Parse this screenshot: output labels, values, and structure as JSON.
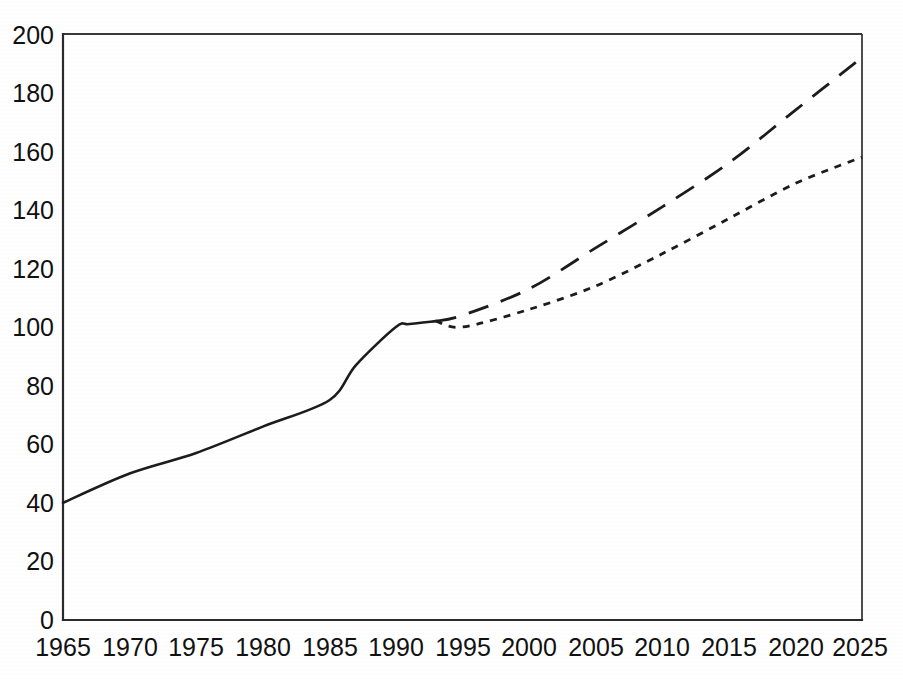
{
  "chart_data": {
    "type": "line",
    "title": "",
    "subtitle": "",
    "xlabel": "",
    "ylabel": "",
    "xlim": [
      1965,
      2025
    ],
    "ylim": [
      0,
      200
    ],
    "grid": false,
    "legend": "none",
    "x_ticks": [
      "1965",
      "1970",
      "1975",
      "1980",
      "1985",
      "1990",
      "1995",
      "2000",
      "2005",
      "2010",
      "2015",
      "2020",
      "2025"
    ],
    "y_ticks": [
      "0",
      "20",
      "40",
      "60",
      "80",
      "100",
      "120",
      "140",
      "160",
      "180",
      "200"
    ],
    "x_tick_values": [
      1965,
      1970,
      1975,
      1980,
      1985,
      1990,
      1995,
      2000,
      2005,
      2010,
      2015,
      2020,
      2025
    ],
    "y_tick_values": [
      0,
      20,
      40,
      60,
      80,
      100,
      120,
      140,
      160,
      180,
      200
    ],
    "series": [
      {
        "name": "historical",
        "style": "solid",
        "color": "#1c1c1c",
        "x": [
          1965,
          1970,
          1975,
          1980,
          1985,
          1987,
          1990,
          1991,
          1993
        ],
        "values": [
          40,
          50,
          57,
          66,
          75,
          87,
          100,
          101,
          102
        ]
      },
      {
        "name": "high-projection",
        "style": "long-dashed",
        "color": "#1c1c1c",
        "x": [
          1993,
          1995,
          2000,
          2005,
          2010,
          2015,
          2020,
          2025
        ],
        "values": [
          102,
          104,
          113,
          127,
          141,
          156,
          174,
          192
        ]
      },
      {
        "name": "low-projection",
        "style": "dotted",
        "color": "#1c1c1c",
        "x": [
          1993,
          1995,
          2000,
          2005,
          2010,
          2015,
          2020,
          2025
        ],
        "values": [
          102,
          100,
          106,
          114,
          125,
          137,
          149,
          158
        ]
      }
    ]
  },
  "figure": {
    "background_color": "#ffffff",
    "axis_color": "#2b2b2b",
    "ink_color": "#1c1c1c"
  }
}
